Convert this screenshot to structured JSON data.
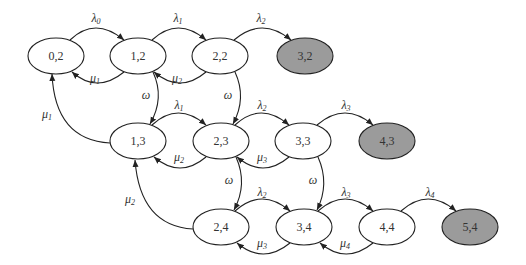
{
  "diagram": {
    "type": "state-transition",
    "colors": {
      "absorbing_fill": "#9b9b9b",
      "normal_fill": "#ffffff",
      "stroke": "#222222"
    },
    "nodes": [
      {
        "id": "0,2",
        "label": "0,2",
        "cx": 56,
        "cy": 56,
        "absorbing": false
      },
      {
        "id": "1,2",
        "label": "1,2",
        "cx": 138,
        "cy": 56,
        "absorbing": false
      },
      {
        "id": "2,2",
        "label": "2,2",
        "cx": 220,
        "cy": 56,
        "absorbing": false
      },
      {
        "id": "3,2",
        "label": "3,2",
        "cx": 305,
        "cy": 56,
        "absorbing": true
      },
      {
        "id": "1,3",
        "label": "1,3",
        "cx": 138,
        "cy": 141,
        "absorbing": false
      },
      {
        "id": "2,3",
        "label": "2,3",
        "cx": 221,
        "cy": 141,
        "absorbing": false
      },
      {
        "id": "3,3",
        "label": "3,3",
        "cx": 303,
        "cy": 141,
        "absorbing": false
      },
      {
        "id": "4,3",
        "label": "4,3",
        "cx": 387,
        "cy": 141,
        "absorbing": true
      },
      {
        "id": "2,4",
        "label": "2,4",
        "cx": 221,
        "cy": 227,
        "absorbing": false
      },
      {
        "id": "3,4",
        "label": "3,4",
        "cx": 304,
        "cy": 227,
        "absorbing": false
      },
      {
        "id": "4,4",
        "label": "4,4",
        "cx": 387,
        "cy": 227,
        "absorbing": false
      },
      {
        "id": "5,4",
        "label": "5,4",
        "cx": 470,
        "cy": 227,
        "absorbing": true
      }
    ],
    "edges": [
      {
        "from": "0,2",
        "to": "1,2",
        "sym": "λ",
        "sub": "0"
      },
      {
        "from": "1,2",
        "to": "2,2",
        "sym": "λ",
        "sub": "1"
      },
      {
        "from": "2,2",
        "to": "3,2",
        "sym": "λ",
        "sub": "2"
      },
      {
        "from": "1,2",
        "to": "0,2",
        "sym": "μ",
        "sub": "1"
      },
      {
        "from": "2,2",
        "to": "1,2",
        "sym": "μ",
        "sub": "2"
      },
      {
        "from": "1,2",
        "to": "1,3",
        "sym": "ω",
        "sub": ""
      },
      {
        "from": "2,2",
        "to": "2,3",
        "sym": "ω",
        "sub": ""
      },
      {
        "from": "1,3",
        "to": "0,2",
        "sym": "μ",
        "sub": "1"
      },
      {
        "from": "1,3",
        "to": "2,3",
        "sym": "λ",
        "sub": "1"
      },
      {
        "from": "2,3",
        "to": "3,3",
        "sym": "λ",
        "sub": "2"
      },
      {
        "from": "3,3",
        "to": "4,3",
        "sym": "λ",
        "sub": "3"
      },
      {
        "from": "2,3",
        "to": "1,3",
        "sym": "μ",
        "sub": "2"
      },
      {
        "from": "3,3",
        "to": "2,3",
        "sym": "μ",
        "sub": "3"
      },
      {
        "from": "2,3",
        "to": "2,4",
        "sym": "ω",
        "sub": ""
      },
      {
        "from": "3,3",
        "to": "3,4",
        "sym": "ω",
        "sub": ""
      },
      {
        "from": "2,4",
        "to": "1,3",
        "sym": "μ",
        "sub": "2"
      },
      {
        "from": "2,4",
        "to": "3,4",
        "sym": "λ",
        "sub": "2"
      },
      {
        "from": "3,4",
        "to": "4,4",
        "sym": "λ",
        "sub": "3"
      },
      {
        "from": "4,4",
        "to": "5,4",
        "sym": "λ",
        "sub": "4"
      },
      {
        "from": "3,4",
        "to": "2,4",
        "sym": "μ",
        "sub": "3"
      },
      {
        "from": "4,4",
        "to": "3,4",
        "sym": "μ",
        "sub": "4"
      }
    ],
    "labels": {
      "n02": "0,2",
      "n12": "1,2",
      "n22": "2,2",
      "n32": "3,2",
      "n13": "1,3",
      "n23": "2,3",
      "n33": "3,3",
      "n43": "4,3",
      "n24": "2,4",
      "n34": "3,4",
      "n44": "4,4",
      "n54": "5,4",
      "lambda": "λ",
      "mu": "μ",
      "omega": "ω",
      "s0": "0",
      "s1": "1",
      "s2": "2",
      "s3": "3",
      "s4": "4"
    }
  }
}
